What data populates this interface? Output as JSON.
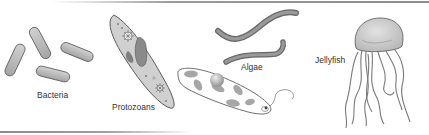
{
  "figure": {
    "labels": {
      "bacteria": "Bacteria",
      "protozoans": "Protozoans",
      "algae": "Algae",
      "jellyfish": "Jellyfish"
    },
    "colors": {
      "cell_fill": "#b8b8b8",
      "cell_stroke": "#555555",
      "organelle": "#8e8e8e",
      "jelly_bell": "#c8c8c8",
      "tentacle": "#9a9a9a",
      "text": "#333333",
      "rule": "#8c8c8c"
    }
  }
}
